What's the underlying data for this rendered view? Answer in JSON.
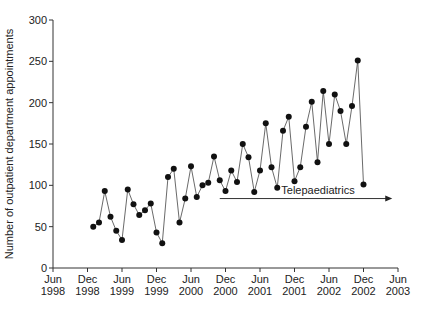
{
  "chart_data": {
    "type": "line",
    "title": "",
    "xlabel": "",
    "ylabel": "Number of outpatient department appointments",
    "ylim": [
      0,
      300
    ],
    "yticks": [
      0,
      50,
      100,
      150,
      200,
      250,
      300
    ],
    "xtick_labels": [
      [
        "Jun",
        "1998"
      ],
      [
        "Dec",
        "1998"
      ],
      [
        "Jun",
        "1999"
      ],
      [
        "Dec",
        "1999"
      ],
      [
        "Jun",
        "2000"
      ],
      [
        "Dec",
        "2000"
      ],
      [
        "Jun",
        "2001"
      ],
      [
        "Dec",
        "2001"
      ],
      [
        "Jun",
        "2002"
      ],
      [
        "Dec",
        "2002"
      ],
      [
        "Jun",
        "2003"
      ]
    ],
    "grid": false,
    "x_start": "Jan 1999",
    "x_end": "Dec 2002",
    "x_step": "1 month",
    "series": [
      {
        "name": "Outpatient appointments",
        "marker": "filled-circle",
        "values": [
          50,
          55,
          93,
          62,
          45,
          34,
          95,
          77,
          64,
          70,
          78,
          43,
          30,
          110,
          120,
          55,
          84,
          123,
          86,
          100,
          103,
          135,
          106,
          93,
          118,
          104,
          150,
          134,
          92,
          118,
          175,
          122,
          97,
          166,
          183,
          105,
          122,
          171,
          201,
          128,
          214,
          150,
          210,
          190,
          150,
          196,
          251,
          101
        ]
      }
    ],
    "annotations": [
      {
        "text": "Telepaediatrics",
        "type": "arrow",
        "from": "Nov 2000",
        "to": "May 2003",
        "y": 84
      }
    ]
  }
}
